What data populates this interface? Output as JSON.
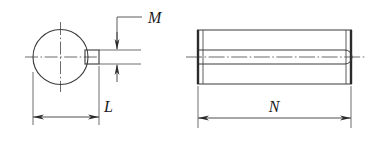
{
  "drawing": {
    "title": "Slotted pin / keyed shaft technical drawing",
    "line_color": "#3a3a3a",
    "thick_line_color": "#2b2b2b",
    "center_line_color": "#555555",
    "background_color": "#ffffff",
    "dimensions": [
      {
        "id": "M",
        "label": "M",
        "orientation": "vertical",
        "view": "end-view",
        "describes": "key width"
      },
      {
        "id": "L",
        "label": "L",
        "orientation": "horizontal",
        "view": "end-view",
        "describes": "overall radial length to key face"
      },
      {
        "id": "N",
        "label": "N",
        "orientation": "horizontal",
        "view": "side-view",
        "describes": "overall pin length"
      }
    ],
    "views": [
      {
        "id": "end-view",
        "name": "end-view",
        "shape": "circle-with-key",
        "circle": {
          "cx": 60.5,
          "cy": 57,
          "r": 27.5
        },
        "key_rect": {
          "x": 85,
          "y": 50,
          "width": 14,
          "height": 14
        }
      },
      {
        "id": "side-view",
        "name": "side-view",
        "shape": "cylinder-with-groove",
        "body": {
          "x": 197,
          "y": 30,
          "width": 155,
          "height": 54
        },
        "groove": {
          "top_y": 50,
          "bottom_y": 64,
          "round_end_x": 345
        }
      }
    ],
    "labels": {
      "m": "M",
      "l": "L",
      "n": "N"
    }
  }
}
